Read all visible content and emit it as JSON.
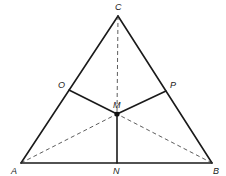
{
  "diagram": {
    "type": "geometry",
    "points": {
      "A": {
        "label": "A",
        "x": 21,
        "y": 163
      },
      "B": {
        "label": "B",
        "x": 212,
        "y": 163
      },
      "C": {
        "label": "C",
        "x": 118,
        "y": 16
      },
      "M": {
        "label": "M",
        "x": 117,
        "y": 114
      },
      "N": {
        "label": "N",
        "x": 117,
        "y": 163
      },
      "O": {
        "label": "O",
        "x": 69,
        "y": 90
      },
      "P": {
        "label": "P",
        "x": 166,
        "y": 91
      }
    },
    "solid_segments": [
      [
        "A",
        "B"
      ],
      [
        "B",
        "C"
      ],
      [
        "C",
        "A"
      ],
      [
        "M",
        "N"
      ],
      [
        "M",
        "O"
      ],
      [
        "M",
        "P"
      ]
    ],
    "dashed_segments": [
      [
        "C",
        "M"
      ],
      [
        "A",
        "M"
      ],
      [
        "B",
        "M"
      ]
    ],
    "colors": {
      "stroke": "#1a1a1a",
      "background": "#ffffff"
    }
  }
}
